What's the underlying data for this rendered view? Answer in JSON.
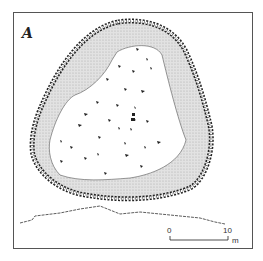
{
  "figure": {
    "type": "archaeological site plan",
    "north_arrow": {
      "label": "A",
      "meaning": "north arrow"
    },
    "scale_bar": {
      "start_label": "0",
      "end_label": "10",
      "unit": "m"
    },
    "features": [
      "enclosure wall (stone)",
      "inner bank (stippled)",
      "interior with scattered stones",
      "profile section"
    ]
  },
  "colors": {
    "ink": "#222222",
    "stipple": "#cfcfcf",
    "frame": "#555555",
    "background": "#ffffff"
  }
}
